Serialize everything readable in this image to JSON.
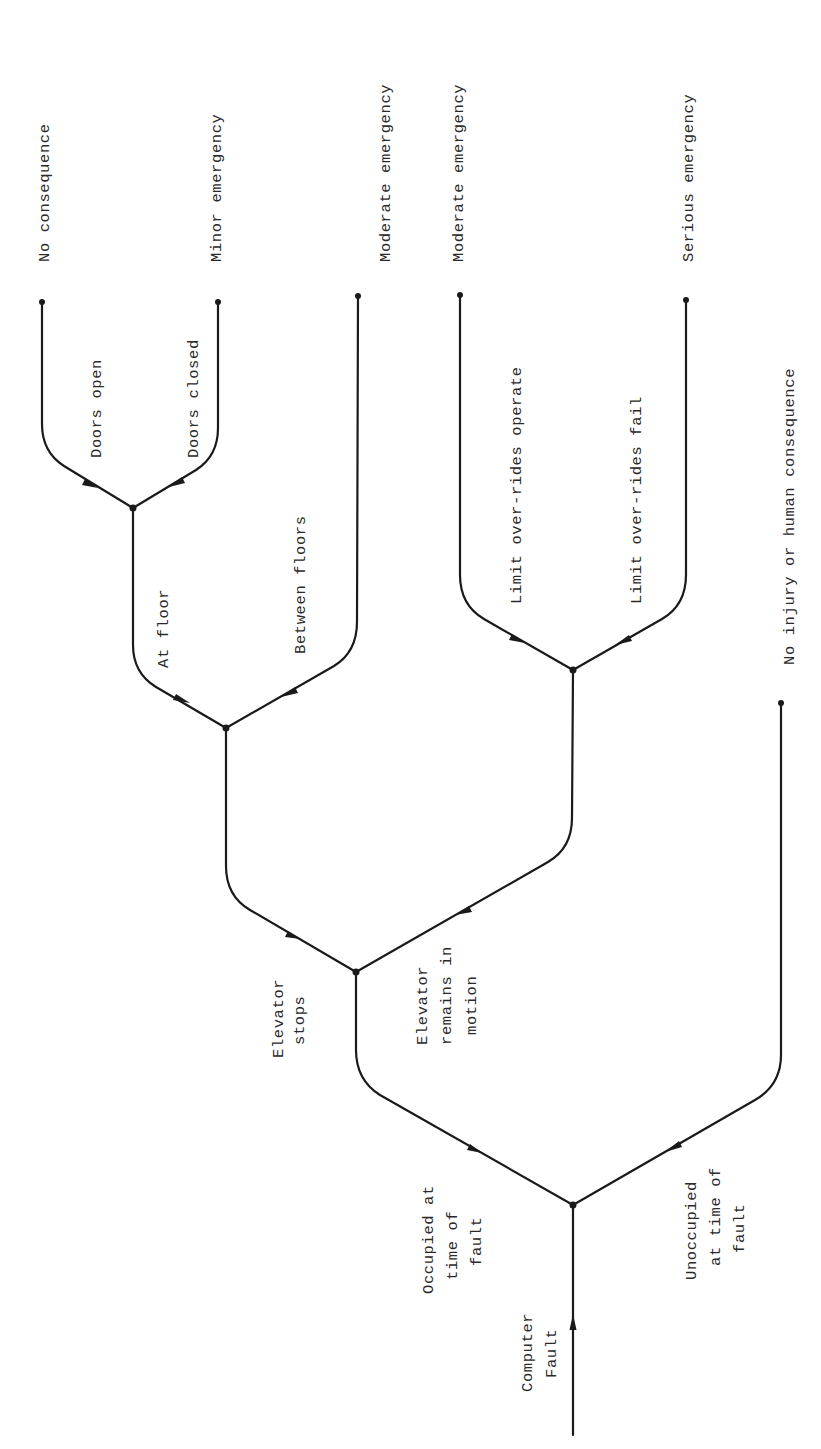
{
  "diagram": {
    "type": "event tree",
    "orientation": "rotated 90 degrees, root at bottom, outcomes at top",
    "initiating_event": "Computer Fault",
    "branches": {
      "occupied": [
        "Occupied at",
        "time of",
        "fault"
      ],
      "unoccupied": [
        "Unoccupied",
        "at time of",
        "fault"
      ],
      "elevator_stops": [
        "Elevator",
        "stops"
      ],
      "elevator_motion": [
        "Elevator",
        "remains in",
        "motion"
      ],
      "at_floor": "At floor",
      "between_floors": "Between floors",
      "doors_open": "Doors open",
      "doors_closed": "Doors closed",
      "limit_operate": "Limit over-rides operate",
      "limit_fail": "Limit over-rides fail"
    },
    "outcomes": {
      "no_consequence": "No consequence",
      "minor_emergency": "Minor emergency",
      "moderate_emergency_1": "Moderate emergency",
      "moderate_emergency_2": "Moderate emergency",
      "serious_emergency": "Serious emergency",
      "no_injury": "No injury or human consequence"
    },
    "paths": [
      {
        "sequence": [
          "Computer Fault",
          "Occupied at time of fault",
          "Elevator stops",
          "At floor",
          "Doors open"
        ],
        "outcome": "No consequence"
      },
      {
        "sequence": [
          "Computer Fault",
          "Occupied at time of fault",
          "Elevator stops",
          "At floor",
          "Doors closed"
        ],
        "outcome": "Minor emergency"
      },
      {
        "sequence": [
          "Computer Fault",
          "Occupied at time of fault",
          "Elevator stops",
          "Between floors"
        ],
        "outcome": "Moderate emergency"
      },
      {
        "sequence": [
          "Computer Fault",
          "Occupied at time of fault",
          "Elevator remains in motion",
          "Limit over-rides operate"
        ],
        "outcome": "Moderate emergency"
      },
      {
        "sequence": [
          "Computer Fault",
          "Occupied at time of fault",
          "Elevator remains in motion",
          "Limit over-rides fail"
        ],
        "outcome": "Serious emergency"
      },
      {
        "sequence": [
          "Computer Fault",
          "Unoccupied at time of fault"
        ],
        "outcome": "No injury or human consequence"
      }
    ],
    "colors": {
      "line": "#1a1a1a",
      "text": "#2a2a2a",
      "background": "#ffffff"
    }
  }
}
